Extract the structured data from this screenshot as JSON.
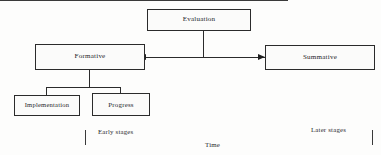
{
  "diagram": {
    "title": "Evaluation",
    "nodes": {
      "evaluation": {
        "label": "Evaluation"
      },
      "formative": {
        "label": "Formative"
      },
      "summative": {
        "label": "Summative"
      },
      "implementation": {
        "label": "Implementation"
      },
      "progress": {
        "label": "Progress"
      }
    },
    "axis": {
      "start_label": "Early stages",
      "end_label": "Later stages",
      "axis_title": "Time"
    },
    "colors": {
      "border": "#2b2b2b",
      "text": "#26262a",
      "background": "#fdfdfc",
      "axis": "#3a3a3a"
    }
  }
}
